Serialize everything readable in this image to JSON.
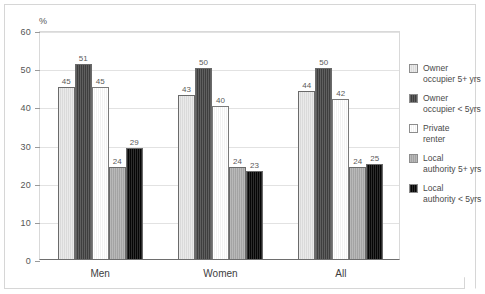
{
  "chart_data": {
    "type": "bar",
    "title": "",
    "subtitle": "",
    "xlabel": "",
    "ylabel": "",
    "unit_label": "%",
    "categories": [
      "Men",
      "Women",
      "All"
    ],
    "series": [
      {
        "name": "Owner occupier 5+ yrs",
        "values": [
          45,
          43,
          44
        ],
        "color": "#e6e6e6"
      },
      {
        "name": "Owner occupier < 5yrs",
        "values": [
          51,
          50,
          50
        ],
        "color": "#414141"
      },
      {
        "name": "Private renter",
        "values": [
          45,
          40,
          42
        ],
        "color": "#ffffff"
      },
      {
        "name": "Local authority 5+ yrs",
        "values": [
          24,
          24,
          24
        ],
        "color": "#acacac"
      },
      {
        "name": "Local authority < 5yrs",
        "values": [
          29,
          23,
          25
        ],
        "color": "#050505"
      }
    ],
    "ylim": [
      0,
      60
    ],
    "yticks": [
      0,
      10,
      20,
      30,
      40,
      50,
      60
    ],
    "ytick_labels": [
      "0",
      "10",
      "20",
      "30",
      "40",
      "50",
      "60"
    ],
    "grid": true,
    "grid_axis": "y",
    "legend_position": "right",
    "data_labels": true
  },
  "legend": {
    "items": [
      {
        "label_line1": "Owner",
        "label_line2": "occupier 5+ yrs"
      },
      {
        "label_line1": "Owner",
        "label_line2": "occupier < 5yrs"
      },
      {
        "label_line1": "Private",
        "label_line2": "renter"
      },
      {
        "label_line1": "Local",
        "label_line2": "authority 5+ yrs"
      },
      {
        "label_line1": "Local",
        "label_line2": "authority < 5yrs"
      }
    ]
  }
}
